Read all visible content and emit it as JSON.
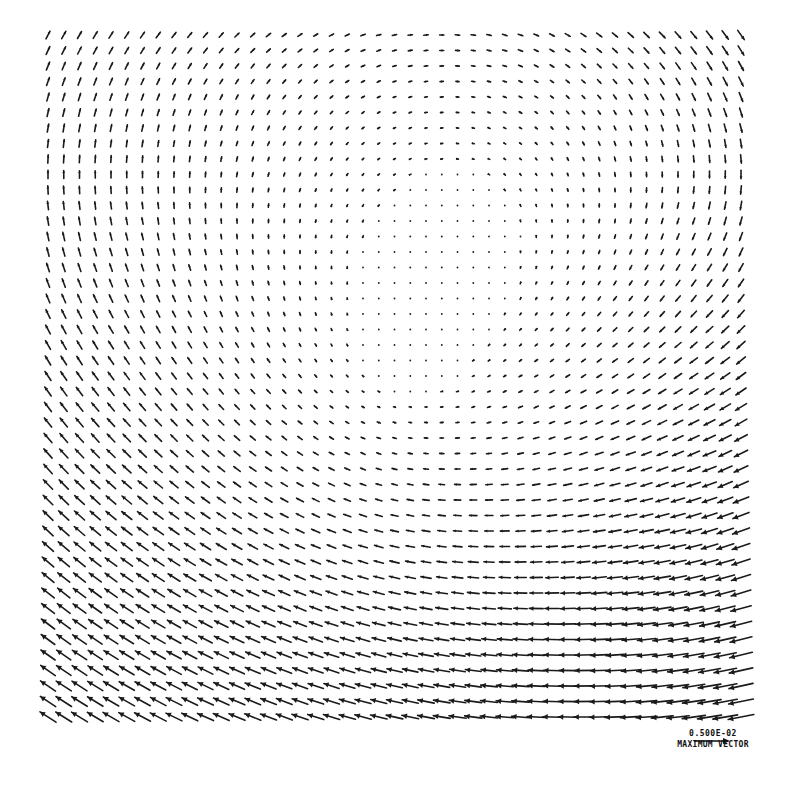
{
  "chart_data": {
    "type": "quiver",
    "title": "",
    "xlabel": "",
    "ylabel": "",
    "grid": false,
    "grid_spec": {
      "columns": 45,
      "rows": 45,
      "x0_px": 48,
      "dx_px": 15.75,
      "y0_px": 35,
      "dy_px": 15.5
    },
    "field_model": {
      "vortex_center": [
        0.52,
        0.47
      ],
      "vortex_strength": 1.0,
      "uniform_flow": [
        -0.55,
        0.25
      ],
      "max_arrow_px": 26
    },
    "sample_vectors": [
      {
        "region": "top-left",
        "direction": "up (slightly up-left)",
        "relative_length": 0.7
      },
      {
        "region": "top-center",
        "direction": "up-right to right",
        "relative_length": 0.5
      },
      {
        "region": "top-right",
        "direction": "right then down",
        "relative_length": 0.6
      },
      {
        "region": "right-wall",
        "direction": "down",
        "relative_length": 0.8
      },
      {
        "region": "right-middle",
        "direction": "down-left to left",
        "relative_length": 0.6
      },
      {
        "region": "center",
        "direction": "near zero (stagnation)",
        "relative_length": 0.05
      },
      {
        "region": "left-middle",
        "direction": "left",
        "relative_length": 0.6
      },
      {
        "region": "bottom-left",
        "direction": "up-left",
        "relative_length": 0.7
      },
      {
        "region": "bottom-right",
        "direction": "up-left",
        "relative_length": 1.0
      }
    ],
    "legend": {
      "value": "0.500E-02",
      "label": "MAXIMUM VECTOR"
    }
  },
  "legend": {
    "value": "0.500E-02",
    "label": "MAXIMUM VECTOR"
  },
  "colors": {
    "arrow": "#1a1a1a",
    "background": "#ffffff"
  }
}
